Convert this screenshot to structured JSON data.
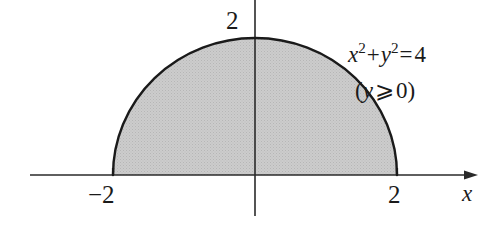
{
  "figure": {
    "type": "semicircle-region-diagram",
    "colors": {
      "fill": "#c9c9c9",
      "stroke": "#1a1a1a",
      "axis": "#1a1a1a",
      "background": "#ffffff"
    },
    "geometry": {
      "center_x_px": 255,
      "baseline_y_px": 175,
      "radius_x_px": 142,
      "radius_y_px": 137,
      "x_axis_start_px": 30,
      "x_axis_end_px": 478,
      "y_axis_top_px": 0,
      "y_axis_bottom_px": 216
    },
    "axes": {
      "x_axis_label": "x",
      "x_axis_has_arrow": true,
      "y_axis_label": "",
      "y_axis_has_arrow": false
    },
    "tick_labels": {
      "y_top": "2",
      "x_negative": "−2",
      "x_positive": "2"
    },
    "annotation": {
      "equation_lhs_x": "x",
      "equation_x_exponent": "2",
      "equation_plus": "+",
      "equation_lhs_y": "y",
      "equation_y_exponent": "2",
      "equation_equals": "=",
      "equation_rhs": "4",
      "condition_open_paren": "(",
      "condition_variable": "y",
      "condition_relation": "⩾",
      "condition_value": "0",
      "condition_close_paren": ")"
    }
  }
}
